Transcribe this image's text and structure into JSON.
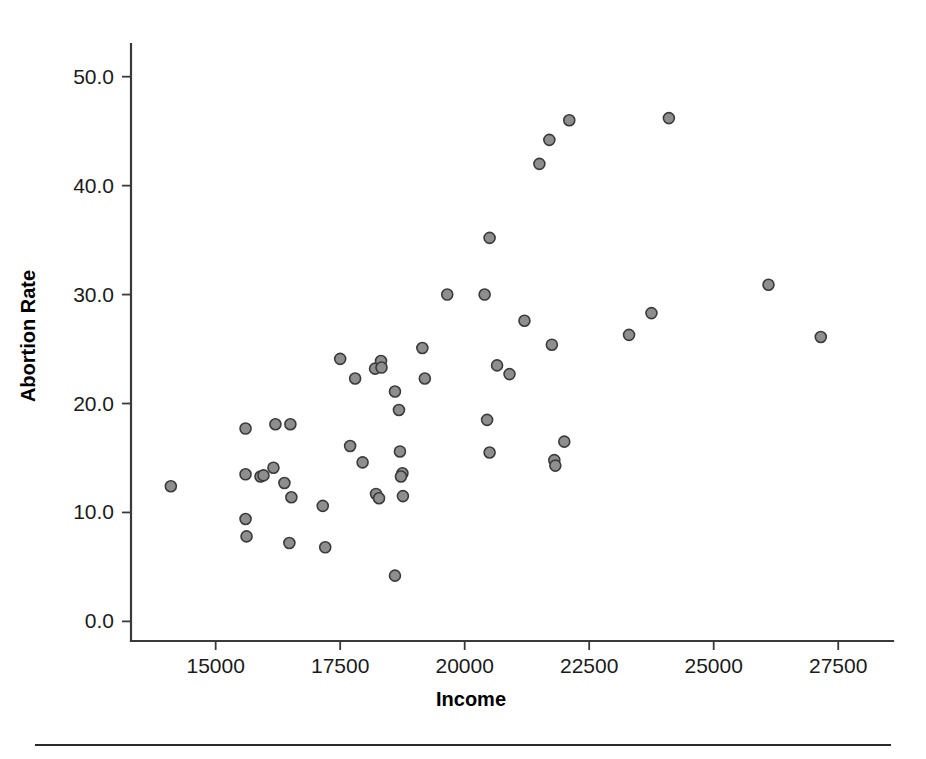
{
  "figure": {
    "background_color": "#ffffff",
    "marker_fill_color": "#8e8e8e",
    "marker_edge_color": "#3b3b3b",
    "axis_color": "#3a3a3a"
  },
  "chart_data": {
    "type": "scatter",
    "title": "",
    "xlabel": "Income",
    "ylabel": "Abortion Rate",
    "xlim": [
      13300,
      28600
    ],
    "ylim": [
      -1.8,
      53.0
    ],
    "grid": false,
    "legend": null,
    "xticks": [
      15000,
      17500,
      20000,
      22500,
      25000,
      27500
    ],
    "xticklabels": [
      "15000",
      "17500",
      "20000",
      "22500",
      "25000",
      "27500"
    ],
    "yticks": [
      0.0,
      10.0,
      20.0,
      30.0,
      40.0,
      50.0
    ],
    "yticklabels": [
      "0.0",
      "10.0",
      "20.0",
      "30.0",
      "40.0",
      "50.0"
    ],
    "marker": "circle",
    "marker_size": 11,
    "points": [
      {
        "x": 14100,
        "y": 12.4
      },
      {
        "x": 15600,
        "y": 17.7
      },
      {
        "x": 15600,
        "y": 13.5
      },
      {
        "x": 15600,
        "y": 9.4
      },
      {
        "x": 15620,
        "y": 7.8
      },
      {
        "x": 15900,
        "y": 13.3
      },
      {
        "x": 15960,
        "y": 13.4
      },
      {
        "x": 16200,
        "y": 18.1
      },
      {
        "x": 16160,
        "y": 14.1
      },
      {
        "x": 16500,
        "y": 18.1
      },
      {
        "x": 16380,
        "y": 12.7
      },
      {
        "x": 16520,
        "y": 11.4
      },
      {
        "x": 16480,
        "y": 7.2
      },
      {
        "x": 17150,
        "y": 10.6
      },
      {
        "x": 17200,
        "y": 6.8
      },
      {
        "x": 17500,
        "y": 24.1
      },
      {
        "x": 17700,
        "y": 16.1
      },
      {
        "x": 17800,
        "y": 22.3
      },
      {
        "x": 17950,
        "y": 14.6
      },
      {
        "x": 18200,
        "y": 23.2
      },
      {
        "x": 18320,
        "y": 23.9
      },
      {
        "x": 18330,
        "y": 23.3
      },
      {
        "x": 18220,
        "y": 11.7
      },
      {
        "x": 18280,
        "y": 11.3
      },
      {
        "x": 18600,
        "y": 21.1
      },
      {
        "x": 18680,
        "y": 19.4
      },
      {
        "x": 18700,
        "y": 15.6
      },
      {
        "x": 18750,
        "y": 13.6
      },
      {
        "x": 18720,
        "y": 13.3
      },
      {
        "x": 18760,
        "y": 11.5
      },
      {
        "x": 18600,
        "y": 4.2
      },
      {
        "x": 19150,
        "y": 25.1
      },
      {
        "x": 19200,
        "y": 22.3
      },
      {
        "x": 19650,
        "y": 30.0
      },
      {
        "x": 20400,
        "y": 30.0
      },
      {
        "x": 20500,
        "y": 35.2
      },
      {
        "x": 20650,
        "y": 23.5
      },
      {
        "x": 20900,
        "y": 22.7
      },
      {
        "x": 20450,
        "y": 18.5
      },
      {
        "x": 20500,
        "y": 15.5
      },
      {
        "x": 21200,
        "y": 27.6
      },
      {
        "x": 21500,
        "y": 42.0
      },
      {
        "x": 21700,
        "y": 44.2
      },
      {
        "x": 21750,
        "y": 25.4
      },
      {
        "x": 21800,
        "y": 14.8
      },
      {
        "x": 21820,
        "y": 14.3
      },
      {
        "x": 22000,
        "y": 16.5
      },
      {
        "x": 22100,
        "y": 46.0
      },
      {
        "x": 23300,
        "y": 26.3
      },
      {
        "x": 23750,
        "y": 28.3
      },
      {
        "x": 24100,
        "y": 46.2
      },
      {
        "x": 26100,
        "y": 30.9
      },
      {
        "x": 27150,
        "y": 26.1
      }
    ]
  }
}
